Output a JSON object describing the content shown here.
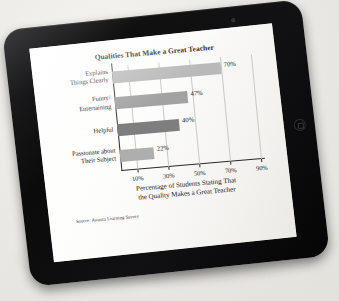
{
  "device": {
    "kind": "tablet",
    "bezel_color": "#0e0e10",
    "background_color": "#eceae6",
    "camera_icon": "camera-dot-icon",
    "home_button_icon": "home-button-icon"
  },
  "chart_data": {
    "type": "bar",
    "orientation": "horizontal",
    "title": "Qualities That Make a Great Teacher",
    "categories": [
      "Explains Things Clearly",
      "Funny/ Entertaining",
      "Helpful",
      "Passionate about Their Subject"
    ],
    "category_lines": [
      [
        "Explains",
        "Things Clearly"
      ],
      [
        "Funny/",
        "Entertaining"
      ],
      [
        "Helpful",
        ""
      ],
      [
        "Passionate about",
        "Their Subject"
      ]
    ],
    "values": [
      70,
      47,
      40,
      22
    ],
    "value_labels": [
      "70%",
      "47%",
      "40%",
      "22%"
    ],
    "bar_colors": [
      "#b9b9b9",
      "#a2a2a2",
      "#7e7e7e",
      "#aeaeae"
    ],
    "xlabel": "Percentage of Students Stating That the Quality Makes a Great Teacher",
    "xlabel_lines": [
      "Percentage of Students Stating That",
      "the Quality Makes a Great Teacher"
    ],
    "ylabel": "",
    "xlim": [
      0,
      90
    ],
    "xticks": [
      10,
      30,
      50,
      70,
      90
    ],
    "xtick_labels": [
      "10%",
      "30%",
      "50%",
      "70%",
      "90%"
    ],
    "grid": true,
    "grid_axis": "x",
    "legend": false,
    "source_note": "Source: Awanta Learning Survey"
  }
}
